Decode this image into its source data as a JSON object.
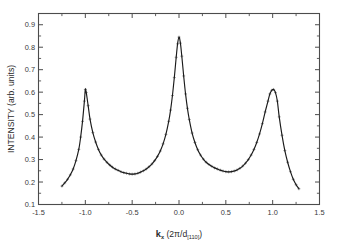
{
  "figure": {
    "background_color": "#ffffff",
    "frame_color": "#4c4c4c",
    "curve_color": "#1a1a1a",
    "marker_color": "#555555"
  },
  "axes": {
    "x_title_symbol": "k",
    "x_title_subscript": "x",
    "x_title_units": " (2π/d",
    "x_title_units_sub": "[110]",
    "x_title_units_close": ")",
    "y_title": "INTENSITY (arb. units)",
    "x_tick_labels": [
      "-1.5",
      "-1.0",
      "-0.5",
      "0.0",
      "0.5",
      "1.0",
      "1.5"
    ],
    "y_tick_labels": [
      "0.1",
      "0.2",
      "0.3",
      "0.4",
      "0.5",
      "0.6",
      "0.7",
      "0.8",
      "0.9"
    ]
  },
  "chart_data": {
    "type": "line",
    "title": "",
    "xlabel": "k_x (2π/d_[110])",
    "ylabel": "INTENSITY (arb. units)",
    "xlim": [
      -1.5,
      1.5
    ],
    "ylim": [
      0.1,
      0.95
    ],
    "xticks": [
      -1.5,
      -1.0,
      -0.5,
      0.0,
      0.5,
      1.0,
      1.5
    ],
    "yticks": [
      0.1,
      0.2,
      0.3,
      0.4,
      0.5,
      0.6,
      0.7,
      0.8,
      0.9
    ],
    "minor_ticks": true,
    "grid": false,
    "legend": null,
    "series": [
      {
        "name": "measured intensity",
        "style": "line-with-markers",
        "marker": "plus",
        "x": [
          -1.25,
          -1.22,
          -1.19,
          -1.16,
          -1.13,
          -1.1,
          -1.07,
          -1.05,
          -1.03,
          -1.01,
          -1.0,
          -0.99,
          -0.97,
          -0.95,
          -0.92,
          -0.89,
          -0.86,
          -0.83,
          -0.8,
          -0.77,
          -0.74,
          -0.71,
          -0.68,
          -0.65,
          -0.62,
          -0.59,
          -0.56,
          -0.53,
          -0.5,
          -0.47,
          -0.44,
          -0.41,
          -0.38,
          -0.35,
          -0.32,
          -0.29,
          -0.26,
          -0.23,
          -0.2,
          -0.17,
          -0.14,
          -0.11,
          -0.09,
          -0.07,
          -0.05,
          -0.03,
          -0.015,
          0.0,
          0.015,
          0.03,
          0.05,
          0.07,
          0.09,
          0.11,
          0.14,
          0.17,
          0.2,
          0.23,
          0.26,
          0.29,
          0.32,
          0.35,
          0.38,
          0.41,
          0.44,
          0.47,
          0.5,
          0.53,
          0.56,
          0.59,
          0.62,
          0.65,
          0.68,
          0.71,
          0.74,
          0.77,
          0.8,
          0.83,
          0.86,
          0.89,
          0.92,
          0.95,
          0.97,
          0.99,
          1.01,
          1.03,
          1.05,
          1.07,
          1.1,
          1.13,
          1.16,
          1.19,
          1.22,
          1.25,
          1.28
        ],
        "y": [
          0.182,
          0.196,
          0.212,
          0.232,
          0.258,
          0.295,
          0.345,
          0.4,
          0.47,
          0.56,
          0.612,
          0.598,
          0.54,
          0.48,
          0.42,
          0.378,
          0.345,
          0.32,
          0.302,
          0.288,
          0.276,
          0.266,
          0.258,
          0.252,
          0.246,
          0.242,
          0.239,
          0.236,
          0.235,
          0.236,
          0.239,
          0.244,
          0.25,
          0.258,
          0.268,
          0.28,
          0.295,
          0.314,
          0.338,
          0.37,
          0.412,
          0.47,
          0.52,
          0.585,
          0.665,
          0.755,
          0.815,
          0.845,
          0.818,
          0.76,
          0.672,
          0.592,
          0.528,
          0.478,
          0.418,
          0.376,
          0.344,
          0.32,
          0.302,
          0.288,
          0.278,
          0.27,
          0.263,
          0.258,
          0.253,
          0.249,
          0.246,
          0.245,
          0.246,
          0.249,
          0.254,
          0.261,
          0.271,
          0.284,
          0.3,
          0.32,
          0.345,
          0.376,
          0.414,
          0.46,
          0.512,
          0.56,
          0.592,
          0.608,
          0.612,
          0.598,
          0.56,
          0.49,
          0.408,
          0.34,
          0.288,
          0.246,
          0.212,
          0.188,
          0.17
        ]
      }
    ],
    "peaks": [
      {
        "x": -1.0,
        "y": 0.615,
        "label": "Bragg peak -1"
      },
      {
        "x": 0.0,
        "y": 0.845,
        "label": "central peak"
      },
      {
        "x": 1.02,
        "y": 0.612,
        "label": "Bragg peak +1"
      }
    ],
    "minima": [
      {
        "x": -0.52,
        "y": 0.235
      },
      {
        "x": 0.54,
        "y": 0.245
      }
    ]
  }
}
